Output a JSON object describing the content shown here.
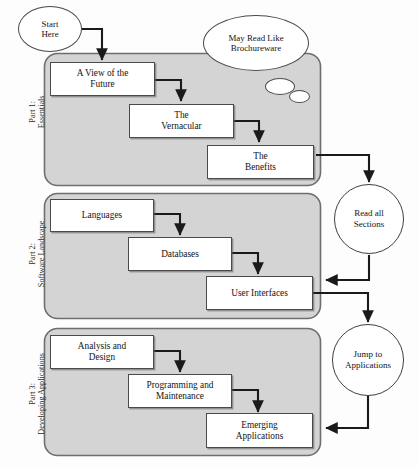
{
  "diagram": {
    "type": "flowchart",
    "colors": {
      "panel_fill": "#d4d4d4",
      "panel_border": "#6e6e6e",
      "node_fill": "#ffffff",
      "node_border": "#4a4a4a",
      "arrow": "#1a1a1a",
      "page_background": "#fdfdfd"
    }
  },
  "parts": [
    {
      "id": "part-1",
      "label_line1": "Part 1:",
      "label_line2": "Essentials",
      "nodes": [
        {
          "id": "a-view-of-the-future",
          "label": "A View of the\nFuture"
        },
        {
          "id": "the-vernacular",
          "label": "The\nVernacular"
        },
        {
          "id": "the-benefits",
          "label": "The\nBenefits"
        }
      ]
    },
    {
      "id": "part-2",
      "label_line1": "Part 2:",
      "label_line2": "Software Landscape",
      "nodes": [
        {
          "id": "languages",
          "label": "Languages"
        },
        {
          "id": "databases",
          "label": "Databases"
        },
        {
          "id": "user-interfaces",
          "label": "User Interfaces"
        }
      ]
    },
    {
      "id": "part-3",
      "label_line1": "Part 3:",
      "label_line2": "Developing Applications",
      "nodes": [
        {
          "id": "analysis-and-design",
          "label": "Analysis and\nDesign"
        },
        {
          "id": "programming-and-maintenance",
          "label": "Programming and\nMaintenance"
        },
        {
          "id": "emerging-applications",
          "label": "Emerging\nApplications"
        }
      ]
    }
  ],
  "callouts": {
    "start_here": "Start\nHere",
    "may_read_like_brochureware": "May Read Like\nBrochureware",
    "read_all_sections": "Read all\nSections",
    "jump_to_applications": "Jump to\nApplications"
  },
  "connections": [
    {
      "from": "start-here",
      "to": "a-view-of-the-future"
    },
    {
      "from": "a-view-of-the-future",
      "to": "the-vernacular"
    },
    {
      "from": "the-vernacular",
      "to": "the-benefits"
    },
    {
      "from": "part-1",
      "to": "read-all-sections"
    },
    {
      "from": "read-all-sections",
      "to": "part-2"
    },
    {
      "from": "languages",
      "to": "databases"
    },
    {
      "from": "databases",
      "to": "user-interfaces"
    },
    {
      "from": "part-2",
      "to": "jump-to-applications"
    },
    {
      "from": "jump-to-applications",
      "to": "part-3"
    },
    {
      "from": "analysis-and-design",
      "to": "programming-and-maintenance"
    },
    {
      "from": "programming-and-maintenance",
      "to": "emerging-applications"
    }
  ]
}
